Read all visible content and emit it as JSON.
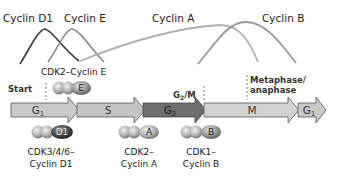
{
  "curves": {
    "cyclin_d1": {
      "label": "Cyclin D1",
      "color": "#3a3a3a"
    },
    "cyclin_e": {
      "label": "Cyclin E",
      "color": "#8a8a8a"
    },
    "cyclin_a": {
      "label": "Cyclin A",
      "color": "#a8a8a8"
    },
    "cyclin_b": {
      "label": "Cyclin B",
      "color": "#9a9a9a"
    }
  },
  "checkpoints": {
    "start": "Start",
    "g2m": "G2/M",
    "g2m_main": "G",
    "g2m_sub": "2",
    "g2m_tail": "/M",
    "metaphase_line1": "Metaphase/",
    "metaphase_line2": "anaphase"
  },
  "phases": [
    {
      "main": "G",
      "sub": "1",
      "color": "#c9c9c9"
    },
    {
      "main": "S",
      "sub": "",
      "color": "#c4c4c4"
    },
    {
      "main": "G",
      "sub": "2",
      "color": "#707070"
    },
    {
      "main": "M",
      "sub": "",
      "color": "#d0d0d0"
    },
    {
      "main": "G",
      "sub": "1",
      "color": "#c9c9c9"
    }
  ],
  "complexes": {
    "cdk2_cyclin_e": {
      "label": "CDK2–Cyclin E",
      "letter": "E"
    },
    "cdk346_cyclin_d1": {
      "line1": "CDK3/4/6–",
      "line2": "Cyclin D1",
      "letter": "D1"
    },
    "cdk2_cyclin_a": {
      "line1": "CDK2–",
      "line2": "Cyclin A",
      "letter": "A"
    },
    "cdk1_cyclin_b": {
      "line1": "CDK1–",
      "line2": "Cyclin B",
      "letter": "B"
    }
  }
}
